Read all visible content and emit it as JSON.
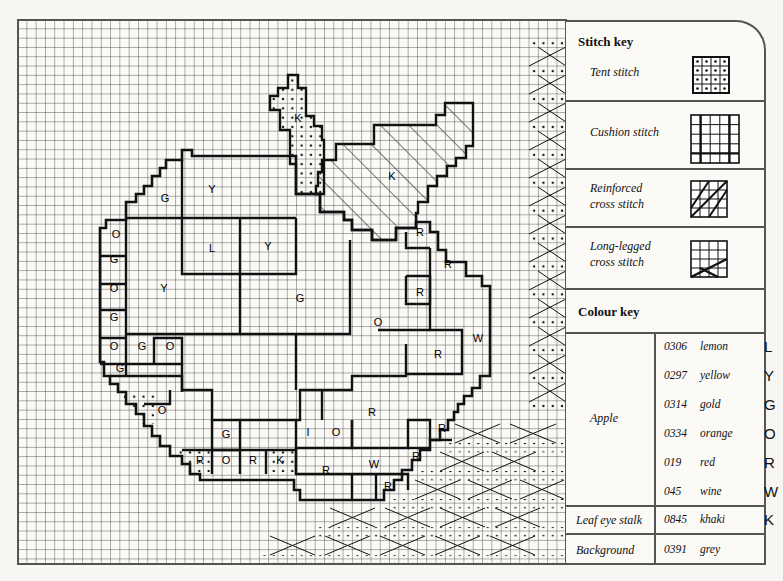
{
  "chart": {
    "grid": {
      "left": 18,
      "top": 20,
      "right": 566,
      "bottom": 564,
      "pitch": 9.3
    },
    "region_letters": [
      {
        "t": "K",
        "x": 298,
        "y": 122
      },
      {
        "t": "K",
        "x": 392,
        "y": 180
      },
      {
        "t": "Y",
        "x": 212,
        "y": 193
      },
      {
        "t": "G",
        "x": 165,
        "y": 202
      },
      {
        "t": "O",
        "x": 116,
        "y": 238
      },
      {
        "t": "L",
        "x": 212,
        "y": 252
      },
      {
        "t": "Y",
        "x": 268,
        "y": 250
      },
      {
        "t": "R",
        "x": 420,
        "y": 236
      },
      {
        "t": "G",
        "x": 114,
        "y": 263
      },
      {
        "t": "R",
        "x": 448,
        "y": 268
      },
      {
        "t": "Y",
        "x": 164,
        "y": 292
      },
      {
        "t": "O",
        "x": 114,
        "y": 292
      },
      {
        "t": "R",
        "x": 420,
        "y": 296
      },
      {
        "t": "G",
        "x": 300,
        "y": 302
      },
      {
        "t": "G",
        "x": 114,
        "y": 321
      },
      {
        "t": "O",
        "x": 378,
        "y": 326
      },
      {
        "t": "W",
        "x": 478,
        "y": 342
      },
      {
        "t": "O",
        "x": 114,
        "y": 350
      },
      {
        "t": "G",
        "x": 142,
        "y": 350
      },
      {
        "t": "O",
        "x": 170,
        "y": 350
      },
      {
        "t": "R",
        "x": 438,
        "y": 358
      },
      {
        "t": "G",
        "x": 120,
        "y": 372
      },
      {
        "t": "O",
        "x": 162,
        "y": 414
      },
      {
        "t": "R",
        "x": 372,
        "y": 416
      },
      {
        "t": "G",
        "x": 226,
        "y": 438
      },
      {
        "t": "I",
        "x": 308,
        "y": 436
      },
      {
        "t": "O",
        "x": 336,
        "y": 436
      },
      {
        "t": "R",
        "x": 442,
        "y": 432
      },
      {
        "t": "R",
        "x": 200,
        "y": 464
      },
      {
        "t": "O",
        "x": 226,
        "y": 464
      },
      {
        "t": "R",
        "x": 253,
        "y": 464
      },
      {
        "t": "K",
        "x": 280,
        "y": 464
      },
      {
        "t": "R",
        "x": 326,
        "y": 474
      },
      {
        "t": "W",
        "x": 374,
        "y": 468
      },
      {
        "t": "R",
        "x": 416,
        "y": 460
      },
      {
        "t": "R",
        "x": 388,
        "y": 490
      }
    ]
  },
  "stitch_key": {
    "title": "Stitch key",
    "items": [
      {
        "label_1": "Tent stitch",
        "label_2": "",
        "swatch": "tent"
      },
      {
        "label_1": "Cushion stitch",
        "label_2": "",
        "swatch": "cushion"
      },
      {
        "label_1": "Reinforced",
        "label_2": "cross stitch",
        "swatch": "reinforced-cross"
      },
      {
        "label_1": "Long-legged",
        "label_2": "cross stitch",
        "swatch": "long-legged-cross"
      }
    ]
  },
  "colour_key": {
    "title": "Colour key",
    "groups": [
      {
        "name": "Apple",
        "colours": [
          {
            "code": "0306",
            "name": "lemon",
            "symbol": "L"
          },
          {
            "code": "0297",
            "name": "yellow",
            "symbol": "Y"
          },
          {
            "code": "0314",
            "name": "gold",
            "symbol": "G"
          },
          {
            "code": "0334",
            "name": "orange",
            "symbol": "O"
          },
          {
            "code": "019",
            "name": "red",
            "symbol": "R"
          },
          {
            "code": "045",
            "name": "wine",
            "symbol": "W"
          }
        ]
      },
      {
        "name": "Leaf eye stalk",
        "colours": [
          {
            "code": "0845",
            "name": "khaki",
            "symbol": "K"
          }
        ]
      },
      {
        "name": "Background",
        "colours": [
          {
            "code": "0391",
            "name": "grey",
            "symbol": ""
          }
        ]
      }
    ]
  }
}
